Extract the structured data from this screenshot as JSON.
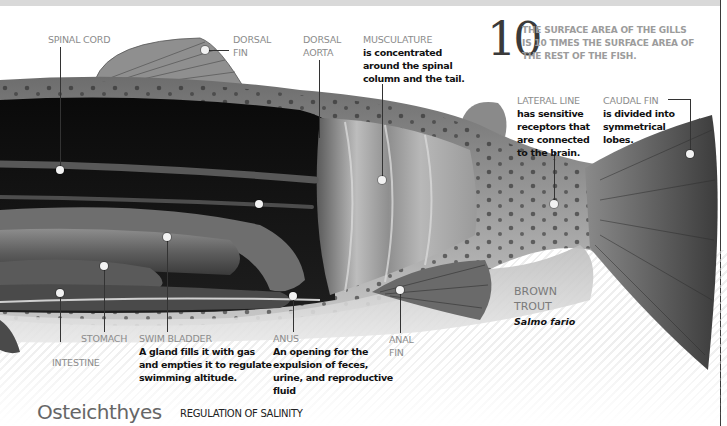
{
  "page": {
    "class_title": "Osteichthyes",
    "section_title": "REGULATION OF SALINITY"
  },
  "fact": {
    "number": "10",
    "text_lines": [
      "THE SURFACE AREA OF THE GILLS",
      "IS 10 TIMES THE SURFACE AREA OF",
      "THE REST OF THE FISH."
    ]
  },
  "species": {
    "common_name_lines": [
      "BROWN",
      "TROUT"
    ],
    "scientific_name": "Salmo fario"
  },
  "labels": {
    "spinal_cord": {
      "title": "SPINAL CORD"
    },
    "dorsal_fin": {
      "title_lines": [
        "DORSAL",
        "FIN"
      ]
    },
    "dorsal_aorta": {
      "title_lines": [
        "DORSAL",
        "AORTA"
      ]
    },
    "musculature": {
      "title": "MUSCULATURE",
      "desc_lines": [
        "is concentrated",
        "around the spinal",
        "column and the tail."
      ]
    },
    "lateral_line": {
      "title": "LATERAL LINE",
      "desc_lines": [
        "has sensitive",
        "receptors that",
        "are connected",
        "to the brain."
      ]
    },
    "caudal_fin": {
      "title": "CAUDAL FIN",
      "desc_lines": [
        "is divided into",
        "symmetrical",
        "lobes."
      ]
    },
    "stomach": {
      "title": "STOMACH"
    },
    "intestine": {
      "title": "INTESTINE"
    },
    "swim_bladder": {
      "title": "SWIM BLADDER",
      "desc_lines": [
        "A gland fills it with gas",
        "and empties it to regulate",
        "swimming altitude."
      ]
    },
    "anus": {
      "title": "ANUS",
      "desc_lines": [
        "An opening for the",
        "expulsion of feces,",
        "urine, and reproductive",
        "fluid"
      ]
    },
    "anal_fin": {
      "title_lines": [
        "ANAL",
        "FIN"
      ]
    }
  }
}
